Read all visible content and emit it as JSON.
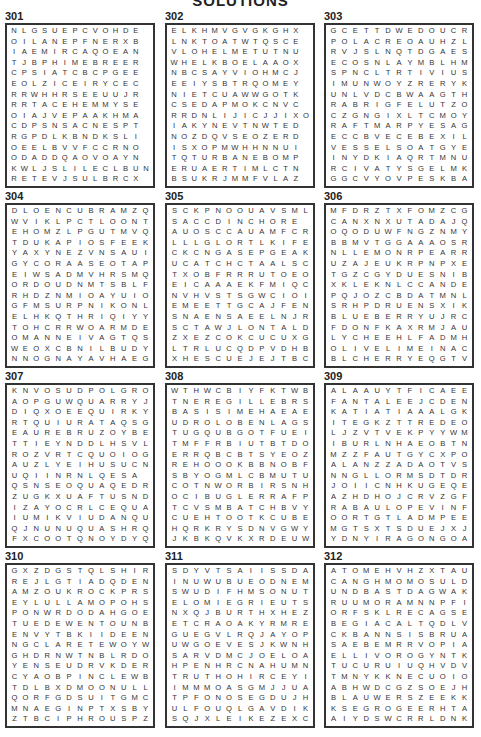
{
  "page": {
    "title": "SOLUTIONS"
  },
  "puzzles": [
    {
      "number": "301",
      "rows": [
        "NLGSUEPCVOHDE",
        "OILANEPFNERXB",
        "IAEMIRCAQOEAN",
        "TJBPHIMEBREER",
        "CPSIATCBCPGEE",
        "EOLZICEIRYCEC",
        "RRWHHRSEEUUJR",
        "RRTACEHEMMYSE",
        "OIAJVEPAAKHMA",
        "CDPSNSACNESPT",
        "RGPDLKBNDKSLI",
        "OEELBVVFCCRNO",
        "ODADDQAOVOAYN",
        "KWLJSLILECLBUN",
        "RETEVJSULBRCX"
      ]
    },
    {
      "number": "302",
      "rows": [
        "ELKHMVGVGKGHX",
        "LNKTOATWTQSCE",
        "VLOHELMETUTNU",
        "WHELKBOELAAOX",
        "NBCSAYVIOHMCJ",
        "EEIYSBTRQOMEY",
        "NIETCUAWWGOTK",
        "CSEDAPMOKCNVC",
        "RRDNLIJICJJIXO",
        "IAKYNEVTNWTED",
        "NOZDQVSEOZERD",
        "ISXOPMWHHNNUI",
        "TQTURBANEBOMP",
        "ERUAERTIMLCTN",
        "BSUKRJMMFVLAZ"
      ]
    },
    {
      "number": "303",
      "rows": [
        "GCETTDWEDOUCR",
        "POLACREOAUHZL",
        "RVJSLNQTDGAES",
        "ECOSNLAYMBLHM",
        "SPNCLTRTIVIUS",
        "IMUNWOYZRERYK",
        "UNLVDCBWAAGTH",
        "RABRIGFELUTZO",
        "CZGNGIXLTCMOY",
        "RAFTMARPYESAG",
        "ECCBVECEBEXIL",
        "VESSELSOATGYE",
        "INYDKIAQRTMNU",
        "RCIVATYSGELMK",
        "GGCVYOVPESKBA"
      ]
    },
    {
      "number": "304",
      "rows": [
        "DLOENCUBRAMZQ",
        "WVIKLPCTLOONT",
        "EHOMZLPGUTMVQ",
        "TDUKAPIOSFEEK",
        "YAXYNEZVNSAUI",
        "GYCORAASEOTAP",
        "EIWSADMVHRSMQ",
        "ORDOUDNMTSBLF",
        "RHDZNMIOAYUIO",
        "GFMSURPNIKONL",
        "ELHKQTHRIQIYY",
        "TOHCRRWOARMDE",
        "OMANNEIVAGTQS",
        "WEOXCBNILBUDY",
        "NNOGNAYAVHAEG"
      ]
    },
    {
      "number": "305",
      "rows": [
        "SCKPNOOUAVSML",
        "SACCDINCHORE",
        "AUOSCCAUAMFCR",
        "LLLGLORTLKIFE",
        "CKCNGASEPGEAK",
        "UCATCHCTAALSC",
        "TXOBFRRRUTOEO",
        "EICAAAEKFMIQC",
        "NVHVSTSGWCIOI",
        "EMEETTGCAJFEN",
        "SNAENSAEELNJR",
        "SCTAWJLONTALD",
        "ZXEZCOKCUCUXG",
        "LTRLUCQDPVDHB",
        "XHESCUEJEJTBC"
      ]
    },
    {
      "number": "306",
      "rows": [
        "MFDRZTXFOMZCG",
        "CANXNXUTADAJQ",
        "OQODUWFNGZNMY",
        "BBMVTGGAAAOSR",
        "NLLEMONRPEARR",
        "UZAJEUKRPNPXE",
        "TGZCGYDUESNIB",
        "XKLEKNLCCANDE",
        "PQJOZCBDATMNL",
        "SRHPDRUENSXIK",
        "BLUEBERRYUJRC",
        "FDONFKAXRMJAU",
        "LYCHEEHLFADMH",
        "OLIVELIMEINAC",
        "BLCHERRYEQGTV"
      ]
    },
    {
      "number": "307",
      "rows": [
        "KNVOSUDPOLGRO",
        "AOPGUWQUARRYJ",
        "DIQXOEEQUIRKY",
        "RTQUIURATAQSG",
        "EAUREBRUZOYBE",
        "TTIEYNDDLHSVL",
        "ROZVRTCQUOIOG",
        "AUZLYEIHUSUCN",
        "UQIINRNLQESA",
        "QSNSEOQUAQEDR",
        "ZUGKXUAFTUSND",
        "IZAYOCRLCEQUA",
        "IUMIKVIUDANQU",
        "QJNUNUQUASHRQ",
        "FXCOOTQNOYDYQ"
      ]
    },
    {
      "number": "308",
      "rows": [
        "WTHWCBIYFKTWB",
        "TNEREGILLEBRS",
        "BASISIMEHAEAE",
        "UDROLOBENLAGS",
        "TUGQUBGOTFUEI",
        "TMFFRBIUTBTDO",
        "ERRQBCBTSYEOZ",
        "REHOOOKBBNOBF",
        "SBYOGMLCBMUTU",
        "COTNWORBIRSNH",
        "OCIBUGLERRAFP",
        "TCVSMBATCHBVY",
        "CUEHTOOTKCUBE",
        "HQRKRYSDNVGWY",
        "JKBKQVKXRDEUW"
      ]
    },
    {
      "number": "309",
      "rows": [
        "ALAAUYTFICAEE",
        "FANTALEEJCDEN",
        "KATIATIAAALGK",
        "ITEGKZTTREDEO",
        "LJZVTVEKPYYWM",
        "IBURLNHAEOBTN",
        "MZZFAUTGYCXPO",
        "ALANZZADAOTVS",
        "NNGLLORMSDTDR",
        "JOIICNHKUGEQE",
        "AZHDHOJCRVZGF",
        "RABAULOPEVINF",
        "OORTGTLADMPEE",
        "MGTSXTSDUEJXJ",
        "YDNYIRAGONGOA"
      ]
    },
    {
      "number": "310",
      "rows": [
        "GXZDGSTQLSHIR",
        "REJLGTIADQDEN",
        "AMZOUKROCKPRS",
        "EYLULLAMOPOHS",
        "PONWRDODAHGOE",
        "TUEDEWENTOUNB",
        "ENVYTBKIIDEEN",
        "NGCLARETEWOYW",
        "GHDRNWTNBLRDO",
        "YENSEUDRVKDER",
        "CYAOBPINCLEWB",
        "TDLBXDMOONULL",
        "QORFGDSUITGMC",
        "MNAEGINPTXSBY",
        "ZTBCIPHROUSPZ"
      ]
    },
    {
      "number": "311",
      "rows": [
        "SDYVTSAIISSDA",
        "INUWUBUEODNEM",
        "SWUDIFHMSONUT",
        "ELOMIEGRIEUTS",
        "NXQJBURTHXHEZ",
        "ETCRAOAKYRMRE",
        "GUEGVLRQJAYOP",
        "UWGOEVESJKWNH",
        "SARVDMCJOELOA",
        "HPENHRCNAHUMN",
        "TRUTHOHIRCEYI",
        "IMMMOASGMJJUA",
        "TPFONOSEGDUJH",
        "ULFOUQLGAVDIK",
        "SQJXLEIKEZEXC"
      ]
    },
    {
      "number": "312",
      "rows": [
        "ATOMEHVHZXTAU",
        "CANGHMOMOSULD",
        "UNDBASTDAGWAK",
        "RUUMORAMNNPFI",
        "ORFSKLRECAGSE",
        "BEGIACALTQDLV",
        "CKBANNSISBRUA",
        "SAEBEMRRVOPIA",
        "ELLIVOROGYNTK",
        "TUCURUIUQHVDV",
        "TMNYKKNECUOIO",
        "ABHWDCGZSOEJH",
        "BLAUWERSZEEKK",
        "KSEGROGEERHTA",
        "AIYDSWCRRLDNK"
      ]
    }
  ]
}
